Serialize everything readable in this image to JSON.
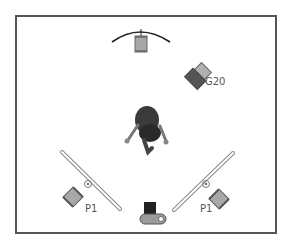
{
  "diagram": {
    "type": "lighting-setup",
    "labels": {
      "hair_light": "G20",
      "fill_left": "P1",
      "fill_right": "P1"
    },
    "colors": {
      "frame": "#555555",
      "light_fill": "#a8a8a8",
      "light_dark": "#555555",
      "reflector": "#c8c8c8",
      "camera_body": "#222222",
      "camera_base": "#9a9a9a"
    }
  }
}
